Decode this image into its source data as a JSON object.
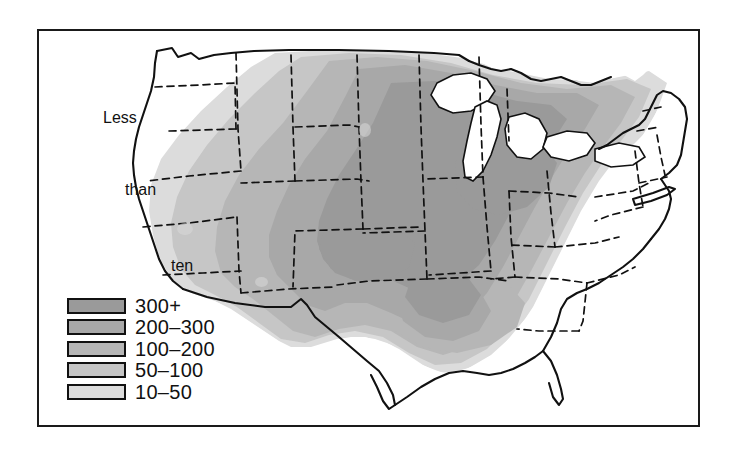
{
  "figure": {
    "type": "choropleth-map",
    "region": "Contiguous United States",
    "background_color": "#ffffff",
    "frame_color": "#1a1a1a"
  },
  "annotation": {
    "line1": "Less",
    "line2": "than",
    "line3": "ten",
    "full_text": "Less than ten"
  },
  "legend": {
    "items": [
      {
        "label": "300+",
        "color": "#9a9a9a",
        "min": 300,
        "max": null
      },
      {
        "label": "200–300",
        "color": "#a8a8a8",
        "min": 200,
        "max": 300
      },
      {
        "label": "100–200",
        "color": "#b6b6b6",
        "min": 100,
        "max": 200
      },
      {
        "label": "50–100",
        "color": "#c6c6c6",
        "min": 50,
        "max": 100
      },
      {
        "label": "10–50",
        "color": "#dcdcdc",
        "min": 10,
        "max": 50
      }
    ]
  },
  "map_style": {
    "coastline_color": "#111111",
    "state_border_color": "#111111",
    "state_border_style": "dashed",
    "lake_fill": "#ffffff"
  }
}
